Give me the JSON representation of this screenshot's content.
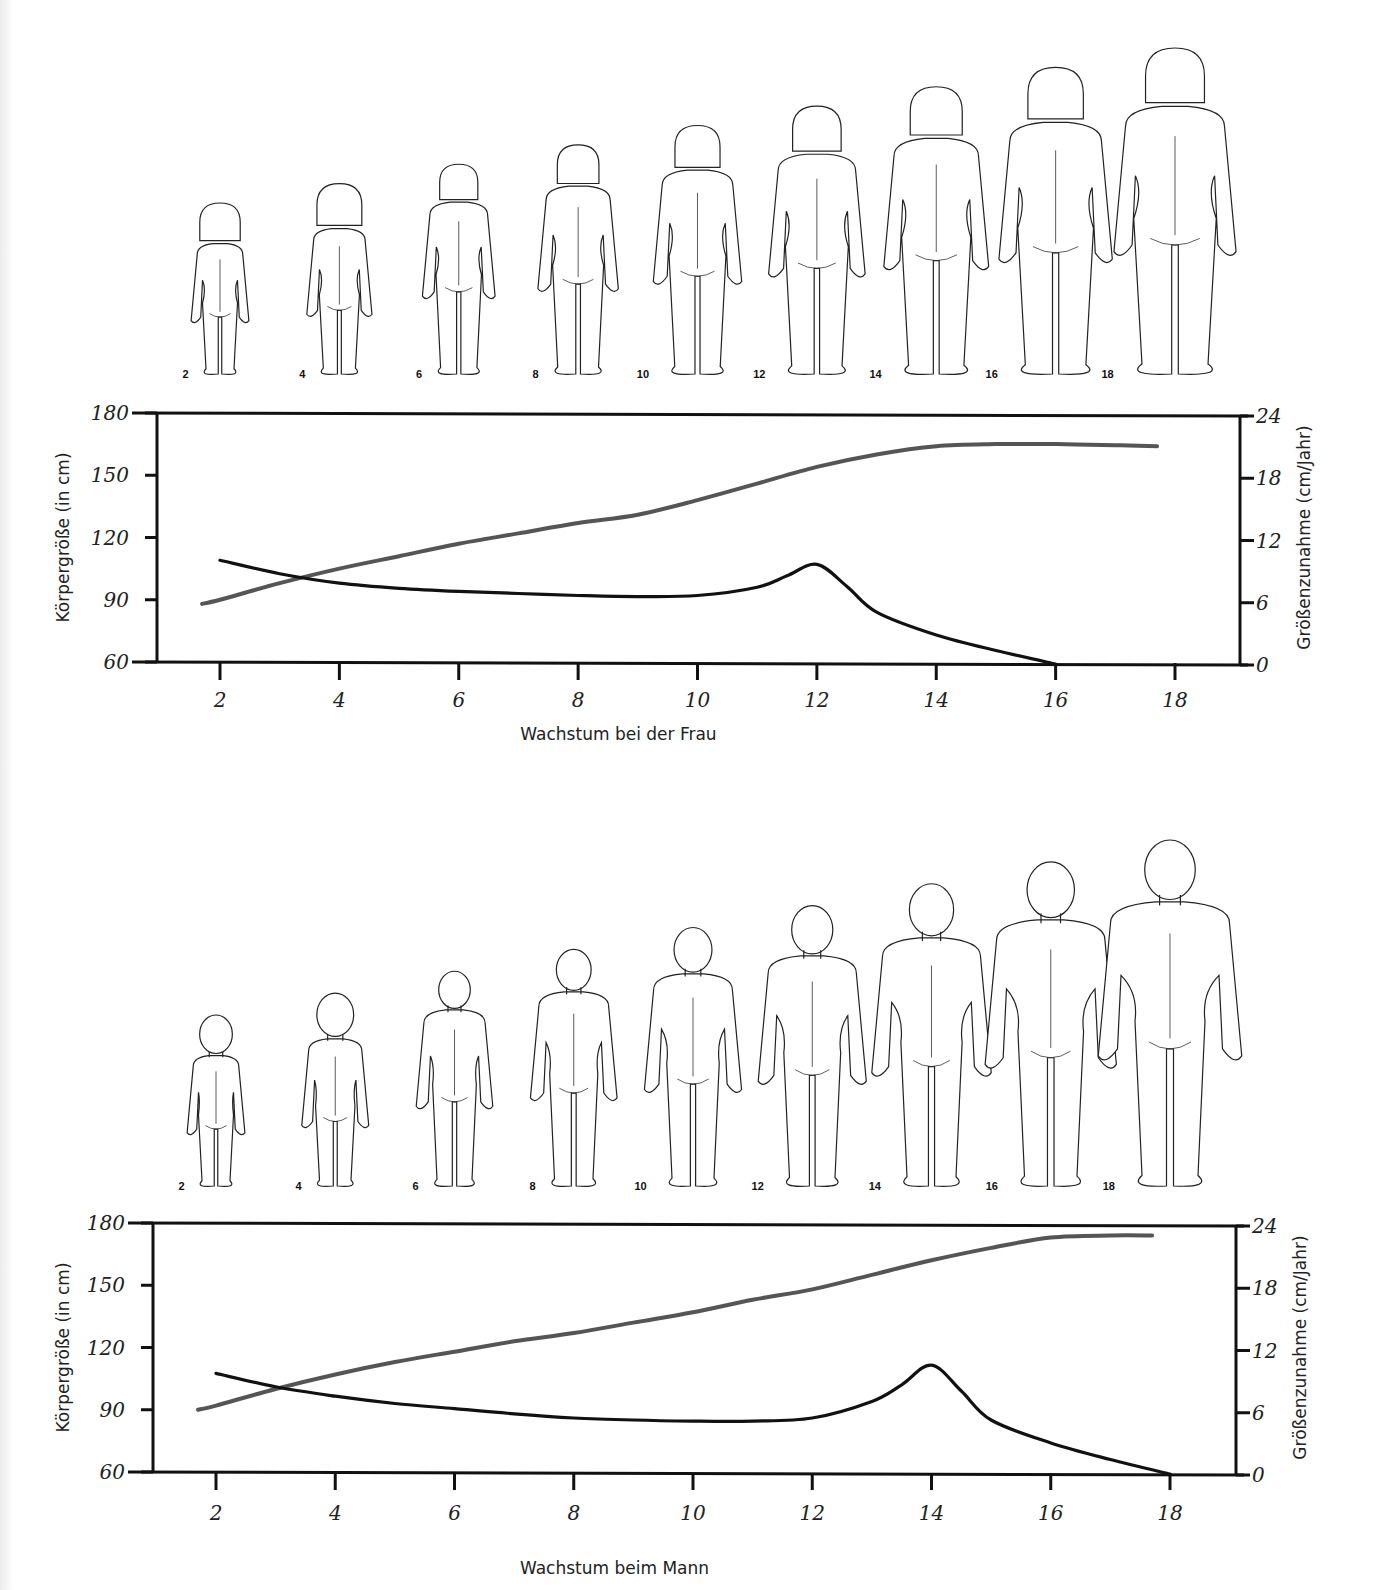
{
  "figures": {
    "female": {
      "title": "Wachstum bei der Frau",
      "ages": [
        "2",
        "4",
        "6",
        "8",
        "10",
        "12",
        "14",
        "16",
        "18"
      ],
      "hair": "bob"
    },
    "male": {
      "title": "Wachstum beim Mann",
      "ages": [
        "2",
        "4",
        "6",
        "8",
        "10",
        "12",
        "14",
        "16",
        "18"
      ],
      "hair": "short"
    }
  },
  "colors": {
    "height_curve": "#555555",
    "velocity_curve": "#111111",
    "axis": "#111111"
  },
  "chart_data": [
    {
      "type": "line",
      "title": "Wachstum bei der Frau",
      "xlabel": "Wachstum bei der Frau",
      "ylabel": "Körpergröße (in cm)",
      "y2label": "Größenzunahme (cm/Jahr)",
      "xticks": [
        "2",
        "4",
        "6",
        "8",
        "10",
        "12",
        "14",
        "16",
        "18"
      ],
      "yticks": [
        "60",
        "90",
        "120",
        "150",
        "180"
      ],
      "y2ticks": [
        "0",
        "6",
        "12",
        "18",
        "24"
      ],
      "ylim": [
        60,
        180
      ],
      "y2lim": [
        0,
        24
      ],
      "grid": false,
      "series": [
        {
          "name": "Körpergröße (cm)",
          "axis": "left",
          "color": "#555555",
          "x": [
            1.7,
            2,
            3,
            4,
            5,
            6,
            7,
            8,
            9,
            10,
            11,
            12,
            13,
            14,
            15,
            16,
            17,
            17.7
          ],
          "y": [
            88,
            90,
            98,
            105,
            111,
            117,
            122,
            127,
            131,
            138,
            146,
            154,
            160,
            164,
            165,
            165,
            164.5,
            164
          ]
        },
        {
          "name": "Größenzunahme (cm/Jahr)",
          "axis": "right",
          "color": "#111111",
          "x": [
            2,
            3,
            4,
            5,
            6,
            7,
            8,
            9,
            10,
            11,
            11.5,
            12,
            12.5,
            13,
            14,
            15,
            16
          ],
          "y": [
            10,
            8.7,
            7.8,
            7.3,
            7.0,
            6.8,
            6.6,
            6.5,
            6.6,
            7.4,
            8.5,
            9.6,
            7.5,
            5.0,
            2.8,
            1.3,
            0
          ]
        }
      ]
    },
    {
      "type": "line",
      "title": "Wachstum beim Mann",
      "xlabel": "Wachstum beim Mann",
      "ylabel": "Körpergröße (in cm)",
      "y2label": "Größenzunahme (cm/Jahr)",
      "xticks": [
        "2",
        "4",
        "6",
        "8",
        "10",
        "12",
        "14",
        "16",
        "18"
      ],
      "yticks": [
        "60",
        "90",
        "120",
        "150",
        "180"
      ],
      "y2ticks": [
        "0",
        "6",
        "12",
        "18",
        "24"
      ],
      "ylim": [
        60,
        180
      ],
      "y2lim": [
        0,
        24
      ],
      "grid": false,
      "series": [
        {
          "name": "Körpergröße (cm)",
          "axis": "left",
          "color": "#555555",
          "x": [
            1.7,
            2,
            3,
            4,
            5,
            6,
            7,
            8,
            9,
            10,
            11,
            12,
            13,
            14,
            15,
            16,
            17,
            17.7
          ],
          "y": [
            90,
            92,
            100,
            107,
            113,
            118,
            123,
            127,
            132,
            137,
            143,
            148,
            155,
            162,
            168,
            173,
            174,
            174
          ]
        },
        {
          "name": "Größenzunahme (cm/Jahr)",
          "axis": "right",
          "color": "#111111",
          "x": [
            2,
            3,
            4,
            5,
            6,
            7,
            8,
            9,
            10,
            11,
            12,
            13,
            13.5,
            14,
            14.5,
            15,
            16,
            17,
            18
          ],
          "y": [
            9.7,
            8.4,
            7.5,
            6.8,
            6.3,
            5.8,
            5.4,
            5.2,
            5.1,
            5.1,
            5.4,
            7.0,
            8.6,
            10.5,
            8.0,
            5.2,
            3.0,
            1.4,
            0
          ]
        }
      ]
    }
  ]
}
